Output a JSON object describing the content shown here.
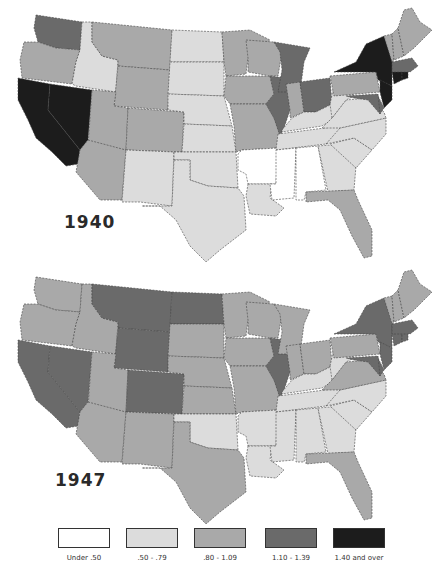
{
  "figure": {
    "maps": [
      {
        "year_label": "1940"
      },
      {
        "year_label": "1947"
      }
    ],
    "legend": [
      {
        "label": "Under .50",
        "color": "#ffffff"
      },
      {
        "label": ".50 - .79",
        "color": "#dcdcdc"
      },
      {
        "label": ".80 - 1.09",
        "color": "#a9a9a9"
      },
      {
        "label": "1.10 - 1.39",
        "color": "#6a6a6a"
      },
      {
        "label": "1.40 and over",
        "color": "#1c1c1c"
      }
    ]
  },
  "map_data": {
    "type": "choropleth",
    "region": "United States (48 states)",
    "classes": [
      "Under .50",
      ".50 - .79",
      ".80 - 1.09",
      "1.10 - 1.39",
      "1.40 and over"
    ],
    "1940": {
      "WA": 3,
      "OR": 2,
      "CA": 4,
      "NV": 4,
      "ID": 1,
      "MT": 2,
      "WY": 2,
      "UT": 2,
      "CO": 2,
      "AZ": 2,
      "NM": 1,
      "ND": 1,
      "SD": 1,
      "NE": 1,
      "KS": 1,
      "OK": 1,
      "TX": 1,
      "MN": 2,
      "IA": 2,
      "MO": 2,
      "AR": 0,
      "LA": 1,
      "WI": 2,
      "IL": 3,
      "MI": 3,
      "IN": 2,
      "OH": 3,
      "KY": 1,
      "TN": 1,
      "MS": 0,
      "AL": 0,
      "GA": 1,
      "FL": 2,
      "SC": 1,
      "NC": 1,
      "VA": 1,
      "WV": 1,
      "PA": 2,
      "NY": 4,
      "NJ": 4,
      "DE": 3,
      "MD": 3,
      "CT": 4,
      "RI": 4,
      "MA": 3,
      "VT": 2,
      "NH": 2,
      "ME": 2
    },
    "1947": {
      "WA": 2,
      "OR": 2,
      "CA": 3,
      "NV": 3,
      "ID": 2,
      "MT": 3,
      "WY": 3,
      "UT": 2,
      "CO": 3,
      "AZ": 2,
      "NM": 2,
      "ND": 3,
      "SD": 2,
      "NE": 2,
      "KS": 2,
      "OK": 1,
      "TX": 2,
      "MN": 2,
      "IA": 2,
      "MO": 2,
      "AR": 1,
      "LA": 1,
      "WI": 2,
      "IL": 3,
      "MI": 2,
      "IN": 2,
      "OH": 2,
      "KY": 1,
      "TN": 1,
      "MS": 1,
      "AL": 1,
      "GA": 1,
      "FL": 2,
      "SC": 1,
      "NC": 1,
      "VA": 2,
      "WV": 1,
      "PA": 2,
      "NY": 3,
      "NJ": 3,
      "DE": 3,
      "MD": 3,
      "CT": 3,
      "RI": 3,
      "MA": 3,
      "VT": 2,
      "NH": 2,
      "ME": 2
    }
  }
}
